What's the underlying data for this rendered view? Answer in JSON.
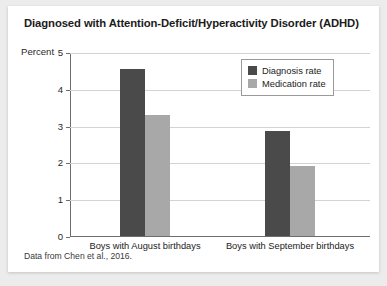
{
  "card": {
    "title": "Diagnosed with Attention-Deficit/Hyperactivity Disorder (ADHD)",
    "source_note": "Data from Chen et al., 2016."
  },
  "legend": {
    "items": [
      {
        "label": "Diagnosis rate",
        "color": "#4a4a4a"
      },
      {
        "label": "Medication rate",
        "color": "#a8a8a8"
      }
    ]
  },
  "chart_data": {
    "type": "bar",
    "title": "Diagnosed with Attention-Deficit/Hyperactivity Disorder (ADHD)",
    "xlabel": "",
    "ylabel": "Percent",
    "ylim": [
      0,
      5
    ],
    "yticks": [
      0,
      1,
      2,
      3,
      4,
      5
    ],
    "ytick_labels": [
      "0",
      "1",
      "2",
      "3",
      "4",
      "5"
    ],
    "grid": true,
    "legend_position": "top-right",
    "categories": [
      "Boys with August birthdays",
      "Boys with September birthdays"
    ],
    "series": [
      {
        "name": "Diagnosis rate",
        "color": "#4a4a4a",
        "values": [
          4.55,
          2.85
        ]
      },
      {
        "name": "Medication rate",
        "color": "#a8a8a8",
        "values": [
          3.3,
          1.9
        ]
      }
    ]
  }
}
